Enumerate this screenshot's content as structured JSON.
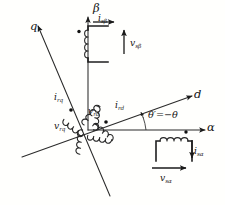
{
  "figure": {
    "type": "vector-frame-diagram",
    "background_color": "#fffffd",
    "ink_color": "#1a1a1a"
  },
  "axes": [
    {
      "id": "alpha",
      "label": "α",
      "description": "stationary real axis, horizontal right"
    },
    {
      "id": "beta",
      "label": "β",
      "description": "stationary quadrature axis, vertical up"
    },
    {
      "id": "d",
      "label": "d",
      "description": "rotor direct axis, up-right"
    },
    {
      "id": "q",
      "label": "q",
      "description": "rotor quadrature axis, up-left"
    }
  ],
  "angle": {
    "label_prime": "θ′",
    "equals": "=",
    "label_value": "−θ",
    "full": "θ′ = −θ"
  },
  "quantities": {
    "i_s_beta": {
      "base": "i",
      "sub": "sβ",
      "kind": "current",
      "frame": "stator",
      "axis": "beta"
    },
    "v_s_beta": {
      "base": "v",
      "sub": "sβ",
      "kind": "voltage",
      "frame": "stator",
      "axis": "beta"
    },
    "i_s_alpha": {
      "base": "i",
      "sub": "sα",
      "kind": "current",
      "frame": "stator",
      "axis": "alpha"
    },
    "v_s_alpha": {
      "base": "v",
      "sub": "sα",
      "kind": "voltage",
      "frame": "stator",
      "axis": "alpha"
    },
    "i_r_d": {
      "base": "i",
      "sub": "rd",
      "kind": "current",
      "frame": "rotor",
      "axis": "d"
    },
    "v_r_d": {
      "base": "v",
      "sub": "rd",
      "kind": "voltage",
      "frame": "rotor",
      "axis": "d"
    },
    "i_r_q": {
      "base": "i",
      "sub": "rq",
      "kind": "current",
      "frame": "rotor",
      "axis": "q"
    },
    "v_r_q": {
      "base": "v",
      "sub": "rq",
      "kind": "voltage",
      "frame": "rotor",
      "axis": "q"
    }
  },
  "windings": [
    {
      "id": "stator-beta-coil",
      "axis": "beta",
      "orientation": "vertical",
      "turns": 4,
      "polarity_dot": true
    },
    {
      "id": "stator-alpha-coil",
      "axis": "alpha",
      "orientation": "horizontal",
      "turns": 4,
      "polarity_dot": true
    },
    {
      "id": "rotor-d-coil",
      "axis": "d",
      "orientation": "diagonal",
      "turns": 9,
      "polarity_dot": true
    },
    {
      "id": "rotor-q-coil",
      "axis": "q",
      "orientation": "diagonal",
      "turns": 9,
      "polarity_dot": true
    }
  ]
}
